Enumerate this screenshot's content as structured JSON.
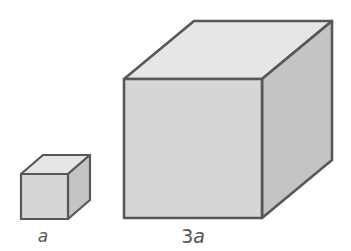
{
  "figure": {
    "colors": {
      "background": "#ffffff",
      "edge": "#585858",
      "top_face": "#e6e6e6",
      "front_face": "#d6d6d6",
      "side_face": "#c4c4c4",
      "label": "#555555"
    },
    "cubes": [
      {
        "name": "small-cube",
        "label_coefficient": "",
        "label_variable": "a",
        "front": {
          "x1": 21,
          "y1": 174,
          "x2": 68,
          "y2": 219
        },
        "depth": {
          "dx": 22,
          "dy": -19
        },
        "label_pos": {
          "x": 43,
          "y": 228
        }
      },
      {
        "name": "large-cube",
        "label_coefficient": "3",
        "label_variable": "a",
        "front": {
          "x1": 124,
          "y1": 79,
          "x2": 262,
          "y2": 218
        },
        "depth": {
          "dx": 70,
          "dy": -58
        },
        "label_pos": {
          "x": 193,
          "y": 227
        }
      }
    ]
  }
}
